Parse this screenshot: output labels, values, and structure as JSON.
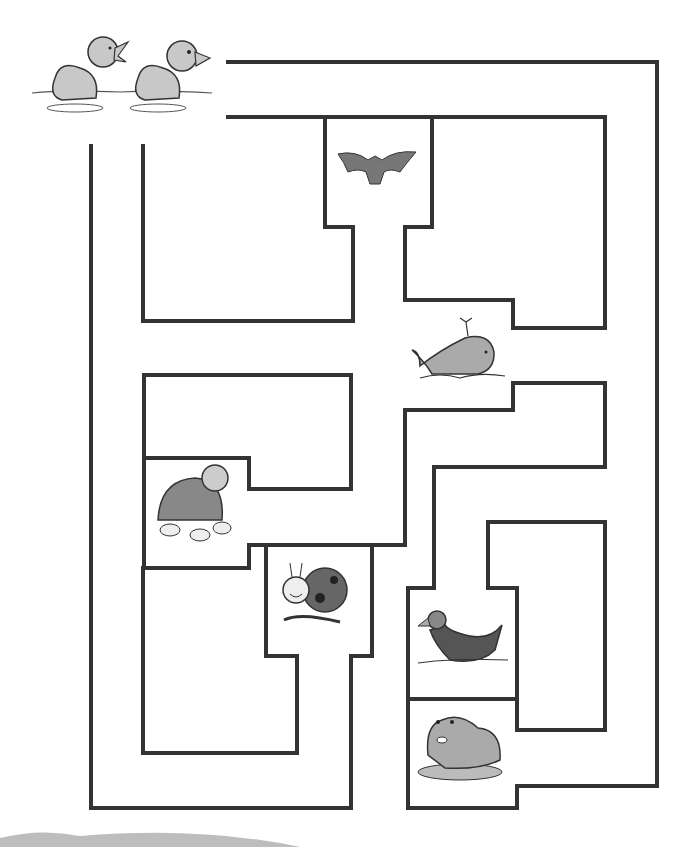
{
  "puzzle": {
    "type": "maze",
    "title": "Duck maze",
    "wall_color": "#333333",
    "start": {
      "name": "ducklings",
      "label": "Two ducklings on water"
    },
    "animals": [
      {
        "id": "bat",
        "label": "Bat"
      },
      {
        "id": "whale",
        "label": "Whale"
      },
      {
        "id": "turtle",
        "label": "Turtle"
      },
      {
        "id": "ladybug",
        "label": "Ladybug"
      },
      {
        "id": "duck",
        "label": "Mother duck"
      },
      {
        "id": "frog",
        "label": "Frog"
      }
    ]
  }
}
